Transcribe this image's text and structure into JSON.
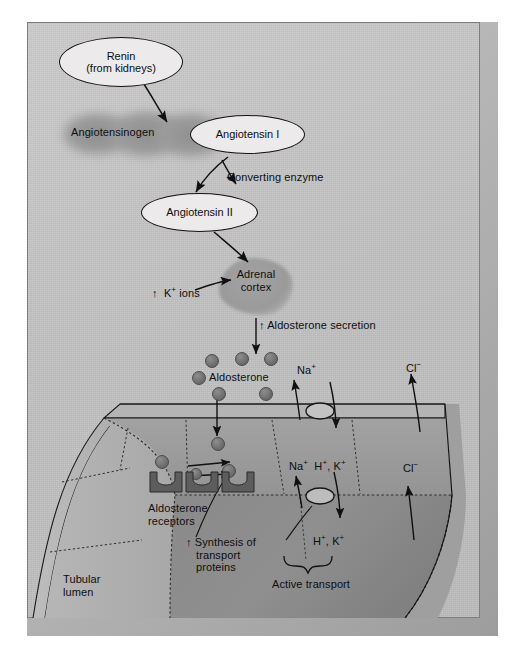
{
  "figure": {
    "background_color": "#c4c4c4",
    "frame_color": "#7d7d7d"
  },
  "nodes": [
    {
      "id": "renin",
      "label": "Renin\n(from kidneys)",
      "line1": "Renin",
      "line2": "(from kidneys)"
    },
    {
      "id": "angiotensin1",
      "label": "Angiotensin I",
      "line1": "Angiotensin I",
      "line2": ""
    },
    {
      "id": "angiotensin2",
      "label": "Angiotensin II",
      "line1": "Angiotensin II",
      "line2": ""
    }
  ],
  "shapes": {
    "angiotensinogen_label": "Angiotensinogen",
    "adrenal_cortex_line1": "Adrenal",
    "adrenal_cortex_line2": "cortex"
  },
  "labels": {
    "converting_enzyme": "Converting enzyme",
    "k_ions": "K+ ions",
    "k_ions_arrow": "↑",
    "aldosterone_secretion": "Aldosterone secretion",
    "aldosterone_secretion_arrow": "↑",
    "aldosterone": "Aldosterone",
    "aldosterone_receptors_line1": "Aldosterone",
    "aldosterone_receptors_line2": "receptors",
    "synthesis_arrow": "↑",
    "synthesis_line1": "Synthesis of",
    "synthesis_line2": "transport",
    "synthesis_line3": "proteins",
    "tubular_lumen_line1": "Tubular",
    "tubular_lumen_line2": "lumen",
    "active_transport": "Active transport"
  },
  "ions": {
    "na_apical": "Na+",
    "cl_apical": "Cl−",
    "na_basal": "Na+",
    "hk_basal": "H+, K+",
    "cl_basal": "Cl−",
    "hk_out": "H+, K+"
  },
  "ion_superscripts": {
    "na": "+",
    "cl": "−",
    "h": "+",
    "k": "+"
  },
  "legend_counts": {
    "aldosterone_dots_extracellular": 6,
    "aldosterone_dots_intracellular": 4,
    "receptor_count": 3
  },
  "colors": {
    "panel": "#c4c4c4",
    "cell_upper": "#9c9c9c",
    "cell_lower": "#8b8b8b",
    "lumen": "#b0b0b0",
    "dot": "#6f6f6f",
    "receptor": "#5a5a5a",
    "stroke": "#131313"
  }
}
